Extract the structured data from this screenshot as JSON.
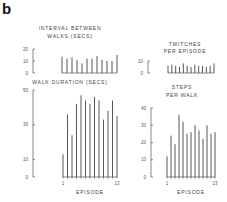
{
  "panel_label": "b",
  "chart_data": [
    {
      "id": "interval",
      "type": "bar",
      "title": [
        "INTERVAL BETWEEN",
        "WALKS (SECS)"
      ],
      "ylim": [
        0,
        20
      ],
      "yticks": [
        0,
        10,
        20
      ],
      "values": [
        13.5,
        12,
        13,
        11,
        8,
        12,
        12,
        14,
        11,
        10,
        10,
        15
      ]
    },
    {
      "id": "twitches",
      "type": "bar",
      "title": [
        "TWITCHES",
        "PER EPISODE"
      ],
      "ylim": [
        0,
        10
      ],
      "yticks": [
        0,
        10
      ],
      "values": [
        6,
        7,
        6,
        5,
        8,
        6,
        5,
        7,
        6,
        6,
        5,
        6,
        8
      ]
    },
    {
      "id": "duration",
      "type": "bar",
      "title": [
        "WALK DURATION (SECS)"
      ],
      "ylim": [
        0,
        50
      ],
      "yticks": [
        0,
        10,
        30,
        50
      ],
      "xlabel": "EPISODE",
      "xticks": [
        "1",
        "13"
      ],
      "values": [
        13,
        36,
        24,
        42,
        47,
        44,
        42,
        46,
        44,
        33,
        38,
        44,
        35
      ]
    },
    {
      "id": "steps",
      "type": "bar",
      "title": [
        "STEPS",
        "PER WALK"
      ],
      "ylim": [
        0,
        40
      ],
      "yticks": [
        0,
        10,
        20,
        30,
        40
      ],
      "xlabel": "EPISODE",
      "xticks": [
        "1",
        "13"
      ],
      "values": [
        12,
        24,
        19,
        36,
        32,
        25,
        26,
        30,
        27,
        22,
        30,
        25,
        26
      ]
    }
  ]
}
